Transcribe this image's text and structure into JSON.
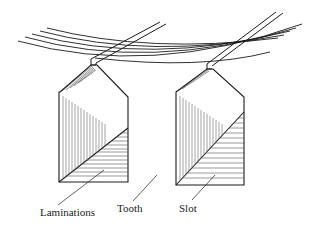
{
  "figure": {
    "labels": {
      "laminations": "Laminations",
      "tooth": "Tooth",
      "slot": "Slot"
    },
    "colors": {
      "line": "#1a1a1a",
      "hatch": "#555555",
      "background": "#ffffff"
    }
  }
}
